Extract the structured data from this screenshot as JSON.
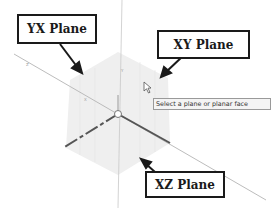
{
  "callouts": {
    "yx_plane": {
      "label": "YX Plane"
    },
    "xy_plane": {
      "label": "XY Plane"
    },
    "xz_plane": {
      "label": "XZ Plane"
    }
  },
  "tooltip": {
    "text": "Select a plane or planar face"
  },
  "colors": {
    "plane_fill": "#eeeeee",
    "axis_dark": "#555555",
    "axis_light": "#b8b8b8",
    "callout_border": "#1a1a1a"
  },
  "origin": {
    "x": 118,
    "y": 114
  }
}
